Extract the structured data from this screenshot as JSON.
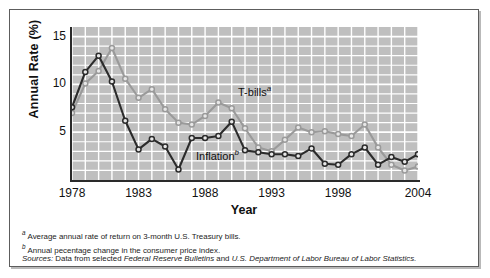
{
  "figure": {
    "y_axis_title": "Annual Rate (%)",
    "x_axis_title": "Year",
    "series_labels": {
      "tbills": "T-bills",
      "tbills_marker": "a",
      "inflation": "Inflation",
      "inflation_marker": "b"
    },
    "footnotes": [
      {
        "marker": "a",
        "text": "Average annual rate of return on 3-month U.S. Treasury bills."
      },
      {
        "marker": "b",
        "text": "Annual pecentage change in the consumer price index."
      }
    ],
    "sources_prefix": "Sources:",
    "sources_text_1": " Data from selected ",
    "sources_italic_1": "Federal Reserve Bulletins",
    "sources_text_2": " and ",
    "sources_italic_2": "U.S. Department of Labor Bureau of Labor Statistics.",
    "colors": {
      "tbills": "#9a9a9a",
      "inflation": "#2b2b2b",
      "plot_bg": "#bfbfbf",
      "grid": "#ffffff",
      "axis": "#2a2a2a"
    }
  },
  "chart_data": {
    "type": "line",
    "title": "",
    "xlabel": "Year",
    "ylabel": "Annual Rate (%)",
    "xlim": [
      1978,
      2004
    ],
    "ylim": [
      0,
      16
    ],
    "yticks": [
      5,
      10,
      15
    ],
    "xticks": [
      1978,
      1983,
      1988,
      1993,
      1998,
      2004
    ],
    "grid": true,
    "legend_position": "inline-annotation",
    "x": [
      1978,
      1979,
      1980,
      1981,
      1982,
      1983,
      1984,
      1985,
      1986,
      1987,
      1988,
      1989,
      1990,
      1991,
      1992,
      1993,
      1994,
      1995,
      1996,
      1997,
      1998,
      1999,
      2000,
      2001,
      2002,
      2003,
      2004
    ],
    "series": [
      {
        "name": "T-bills",
        "note_marker": "a",
        "color": "#9a9a9a",
        "values": [
          7.0,
          10.1,
          11.4,
          13.8,
          10.6,
          8.6,
          9.5,
          7.4,
          6.0,
          5.8,
          6.7,
          8.1,
          7.5,
          5.4,
          3.4,
          3.0,
          4.2,
          5.5,
          5.0,
          5.1,
          4.8,
          4.6,
          5.8,
          3.4,
          1.6,
          1.0,
          1.4
        ]
      },
      {
        "name": "Inflation",
        "note_marker": "b",
        "color": "#2b2b2b",
        "values": [
          7.6,
          11.3,
          13.0,
          10.3,
          6.2,
          3.2,
          4.3,
          3.5,
          1.1,
          4.4,
          4.4,
          4.6,
          6.1,
          3.1,
          2.9,
          2.7,
          2.7,
          2.5,
          3.3,
          1.7,
          1.6,
          2.7,
          3.4,
          1.6,
          2.4,
          1.9,
          2.7
        ]
      }
    ]
  }
}
